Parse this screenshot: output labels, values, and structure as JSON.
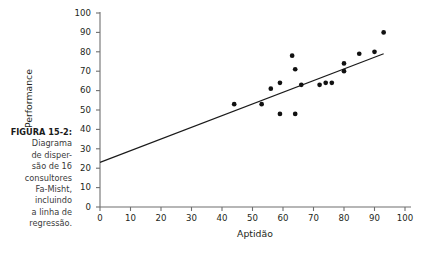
{
  "caption": {
    "figure_label": "FIGURA 15-2:",
    "lines": [
      "Diagrama",
      "de disper-",
      "são de 16",
      "consultores",
      "Fa-Misht,",
      "incluindo",
      "a linha de",
      "regressão."
    ],
    "full_text": "FIGURA 15-2: Diagrama de dispersão de 16 consultores Fa-Misht, incluindo a linha de regressão."
  },
  "colors": {
    "marker": "#111111",
    "axis": "#6f6f6f",
    "line": "#1a1a1a",
    "text": "#231f20",
    "caption_text": "#3b3b3b",
    "background": "#ffffff"
  },
  "chart_data": {
    "type": "scatter",
    "title": "",
    "xlabel": "Aptidão",
    "ylabel": "Performance",
    "xlim": [
      0,
      100
    ],
    "ylim": [
      0,
      100
    ],
    "xticks": [
      0,
      10,
      20,
      30,
      40,
      50,
      60,
      70,
      80,
      90,
      100
    ],
    "yticks": [
      0,
      10,
      20,
      30,
      40,
      50,
      60,
      70,
      80,
      90,
      100
    ],
    "grid": false,
    "legend": null,
    "n_points": 16,
    "points": [
      {
        "x": 44,
        "y": 53
      },
      {
        "x": 53,
        "y": 53
      },
      {
        "x": 56,
        "y": 61
      },
      {
        "x": 59,
        "y": 48
      },
      {
        "x": 59,
        "y": 64
      },
      {
        "x": 63,
        "y": 78
      },
      {
        "x": 64,
        "y": 48
      },
      {
        "x": 64,
        "y": 71
      },
      {
        "x": 66,
        "y": 63
      },
      {
        "x": 72,
        "y": 63
      },
      {
        "x": 74,
        "y": 64
      },
      {
        "x": 76,
        "y": 64
      },
      {
        "x": 80,
        "y": 70
      },
      {
        "x": 80,
        "y": 74
      },
      {
        "x": 85,
        "y": 79
      },
      {
        "x": 90,
        "y": 80
      },
      {
        "x": 93,
        "y": 90
      }
    ],
    "regression_line": {
      "label": "linha de regressão",
      "x_start": 0,
      "y_start": 23,
      "x_end": 93,
      "y_end": 79,
      "intercept": 23,
      "slope": 0.6
    }
  }
}
